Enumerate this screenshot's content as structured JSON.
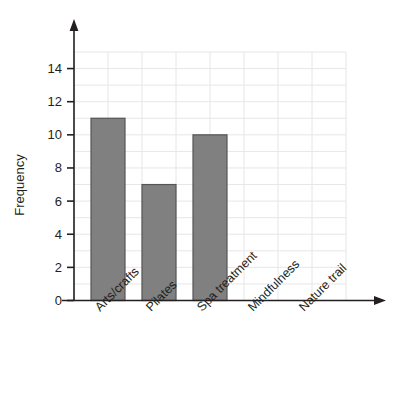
{
  "chart_data": {
    "type": "bar",
    "title": "",
    "xlabel": "",
    "ylabel": "Frequency",
    "categories": [
      "Arts/crafts",
      "Pilates",
      "Spa treatment",
      "Mindfulness",
      "Nature trail"
    ],
    "values": [
      11,
      7,
      10,
      0,
      0
    ],
    "ylim": [
      0,
      15
    ],
    "yticks": [
      0,
      2,
      4,
      6,
      8,
      10,
      12,
      14
    ],
    "ytick_labels": [
      "0",
      "2",
      "4",
      "6",
      "8",
      "10",
      "12",
      "14"
    ],
    "grid": true,
    "legend": false,
    "legend_position": "none",
    "bar_color": "#808080",
    "bar_border_color": "#555555",
    "grid_color": "#e8e6e6",
    "axis_color": "#231f20",
    "category_label_rotation": -45
  },
  "axis": {
    "y_title": "Frequency",
    "ticks": [
      {
        "value": 14,
        "label": "14"
      },
      {
        "value": 12,
        "label": "12"
      },
      {
        "value": 10,
        "label": "10"
      },
      {
        "value": 8,
        "label": "8"
      },
      {
        "value": 6,
        "label": "6"
      },
      {
        "value": 4,
        "label": "4"
      },
      {
        "value": 2,
        "label": "2"
      },
      {
        "value": 0,
        "label": "0"
      }
    ]
  },
  "bars": [
    {
      "label": "Arts/crafts",
      "value": 11
    },
    {
      "label": "Pilates",
      "value": 7
    },
    {
      "label": "Spa treatment",
      "value": 10
    },
    {
      "label": "Mindfulness",
      "value": 0
    },
    {
      "label": "Nature trail",
      "value": 0
    }
  ]
}
